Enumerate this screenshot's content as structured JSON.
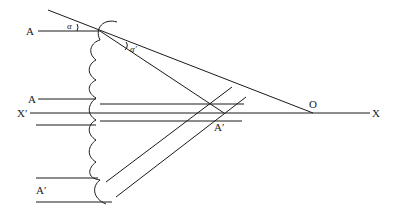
{
  "diagram": {
    "type": "optics-ray-diagram",
    "labels": {
      "A_top": "A",
      "alpha": "α",
      "alpha_prime": "α′",
      "A_mid": "A",
      "X_prime": "X′",
      "A_prime_bottom": "A′",
      "A_prime_center": "A′",
      "O": "O",
      "X": "X"
    },
    "stroke_color": "#1a1a1a",
    "background": "#ffffff"
  }
}
